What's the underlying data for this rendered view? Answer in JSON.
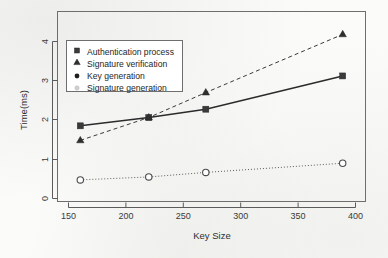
{
  "chart_data": {
    "type": "line",
    "title": "",
    "xlabel": "Key Size",
    "ylabel": "Time(ms)",
    "xlim": [
      140,
      410
    ],
    "ylim": [
      -0.12,
      4.45
    ],
    "grid": false,
    "legend_position": "top-left",
    "x": [
      160,
      220,
      270,
      390
    ],
    "xticks": [
      150,
      200,
      250,
      300,
      350,
      400
    ],
    "xticklabels": [
      "150",
      "200",
      "250",
      "300",
      "350",
      "400"
    ],
    "yticks": [
      0,
      1,
      2,
      3,
      4
    ],
    "yticklabels": [
      "0",
      "1",
      "2",
      "3",
      "4"
    ],
    "series": [
      {
        "name": "Authentication process",
        "marker": "filled-square",
        "linestyle": "solid",
        "color": "#2b2b2b",
        "values": [
          1.7,
          1.9,
          2.1,
          2.9
        ]
      },
      {
        "name": "Signature verification",
        "marker": "filled-triangle",
        "linestyle": "dashed",
        "color": "#3a3a3a",
        "values": [
          1.35,
          1.9,
          2.5,
          3.9
        ]
      },
      {
        "name": "Key generation",
        "marker": "filled-circle",
        "linestyle": "none",
        "color": "#1f1f1f",
        "values": [
          null,
          null,
          null,
          null
        ]
      },
      {
        "name": "Signature generation",
        "marker": "open-circle",
        "linestyle": "dotted",
        "color": "#5d5d5d",
        "values": [
          0.4,
          0.47,
          0.58,
          0.8
        ]
      }
    ]
  },
  "axes": {
    "y_title": "Time(ms)",
    "x_title": "Key Size",
    "xtick_0": "150",
    "xtick_1": "200",
    "xtick_2": "250",
    "xtick_3": "300",
    "xtick_4": "350",
    "xtick_5": "400",
    "ytick_0": "0",
    "ytick_1": "1",
    "ytick_2": "2",
    "ytick_3": "3",
    "ytick_4": "4"
  },
  "legend": {
    "items": [
      {
        "label": "Authentication process",
        "marker": "filled-square"
      },
      {
        "label": "Signature verification",
        "marker": "filled-triangle"
      },
      {
        "label": "Key generation",
        "marker": "filled-circle"
      },
      {
        "label": "Signature generation",
        "marker": "open-circle"
      }
    ]
  }
}
